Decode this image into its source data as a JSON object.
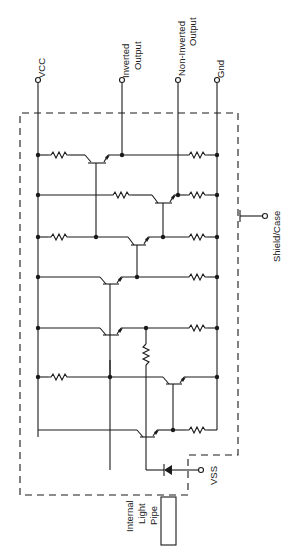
{
  "diagram": {
    "type": "circuit-schematic",
    "orientation": "rotated-90",
    "terminals": {
      "vcc": "VCC",
      "inverted_output_1": "Inverted",
      "inverted_output_2": "Output",
      "non_inverted_output_1": "Non-Inverted",
      "non_inverted_output_2": "Output",
      "gnd": "Gnd",
      "shield_case": "Shield/Case",
      "vss": "VSS"
    },
    "light_pipe": {
      "line1": "Internal",
      "line2": "Light",
      "line3": "Pipe"
    },
    "components": {
      "transistors": 7,
      "resistors": 11,
      "photodiode": 1
    }
  }
}
